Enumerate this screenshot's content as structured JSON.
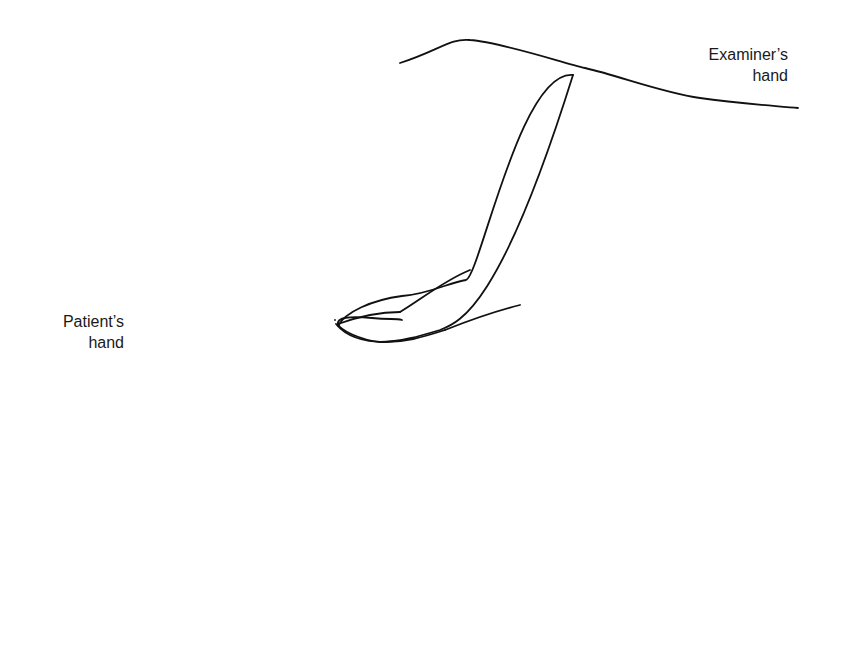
{
  "figure": {
    "labels": {
      "examiner": {
        "line1": "Examiner’s",
        "line2": "hand"
      },
      "patient": {
        "line1": "Patient’s",
        "line2": "hand"
      }
    },
    "annotations": {
      "arrow_flexion_index": "downward curved arrow indicating finger flexion",
      "arrow_flexion_thumb": "upward arrow indicating thumb flexion"
    },
    "colors": {
      "line": "#111111",
      "background": "#ffffff"
    }
  }
}
